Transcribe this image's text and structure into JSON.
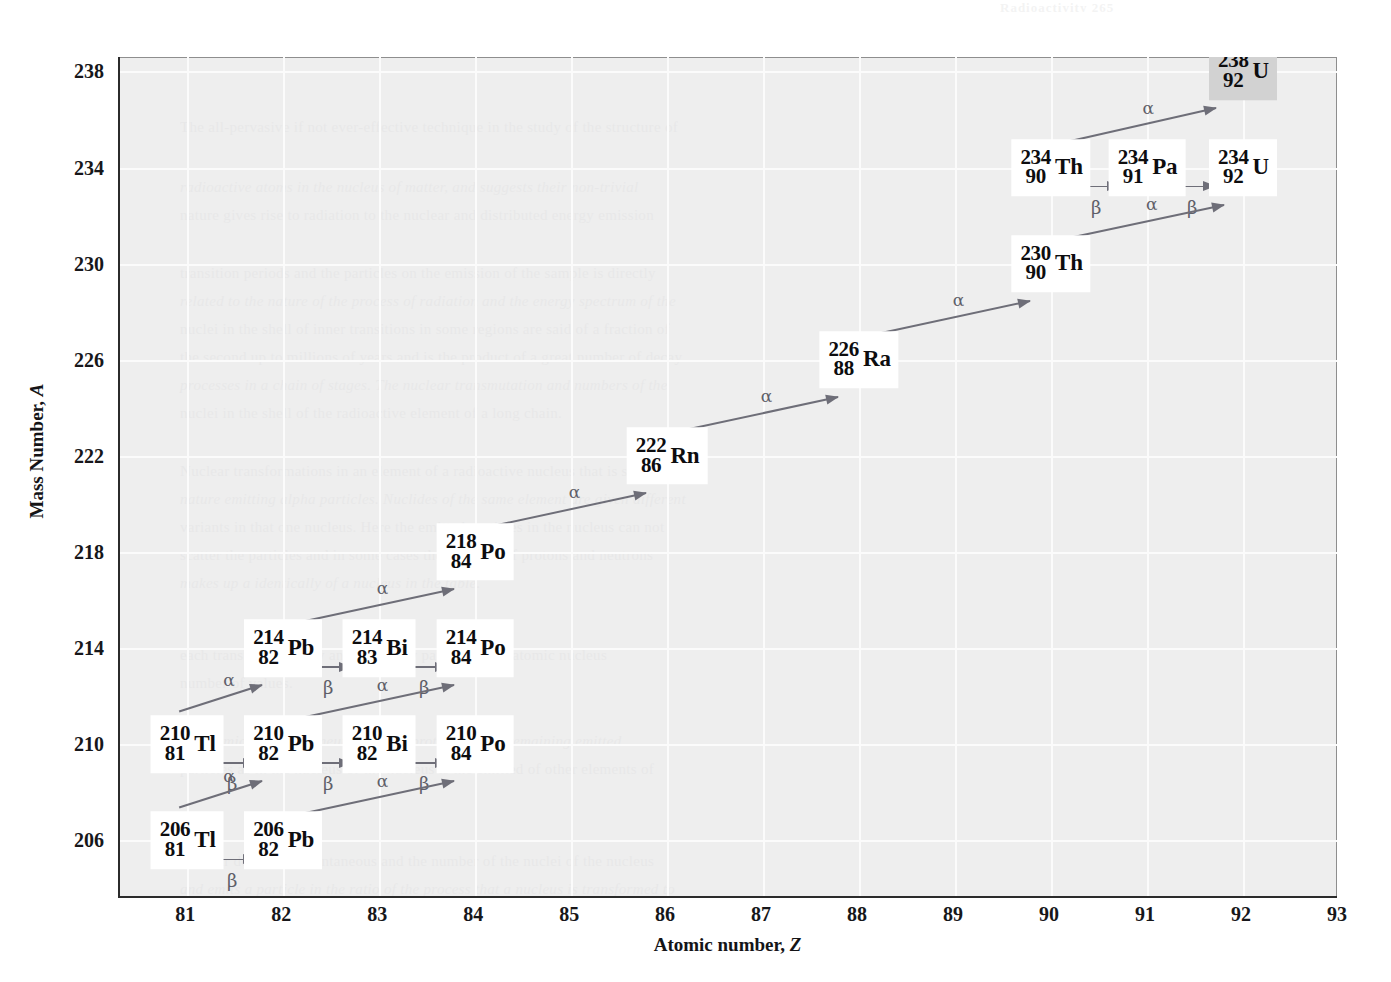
{
  "figure": {
    "bleed_header": "Radioactivity   265",
    "plot_bg_color": "#eeeeee",
    "gridline_color": "#fbfbfb",
    "axis_color": "#2b2b2b",
    "arrow_color": "#6e6e78",
    "box_color": "#ffffff",
    "highlight_box_color": "#d2d2d2"
  },
  "axes": {
    "x": {
      "title_text": "Atomic number, ",
      "title_symbol": "Z",
      "ticks": [
        81,
        82,
        83,
        84,
        85,
        86,
        87,
        88,
        89,
        90,
        91,
        92,
        93
      ],
      "min": 80.3,
      "max": 93.0
    },
    "y": {
      "title_text": "Mass Number, ",
      "title_symbol": "A",
      "ticks": [
        238,
        234,
        230,
        226,
        222,
        218,
        214,
        210,
        206
      ],
      "min": 203.6,
      "max": 238.6
    }
  },
  "chart_data": {
    "type": "scatter",
    "xlabel": "Atomic number, Z",
    "ylabel": "Mass Number, A",
    "xlim": [
      80.3,
      93.0
    ],
    "ylim": [
      203.6,
      238.6
    ],
    "grid": true,
    "legend": "none",
    "nuclides": [
      {
        "id": "U238",
        "a": "238",
        "z": "92",
        "sym": "U",
        "x": 92,
        "y": 238,
        "highlight": true
      },
      {
        "id": "Th234",
        "a": "234",
        "z": "90",
        "sym": "Th",
        "x": 90,
        "y": 234,
        "highlight": false
      },
      {
        "id": "Pa234",
        "a": "234",
        "z": "91",
        "sym": "Pa",
        "x": 91,
        "y": 234,
        "highlight": false
      },
      {
        "id": "U234",
        "a": "234",
        "z": "92",
        "sym": "U",
        "x": 92,
        "y": 234,
        "highlight": false
      },
      {
        "id": "Th230",
        "a": "230",
        "z": "90",
        "sym": "Th",
        "x": 90,
        "y": 230,
        "highlight": false
      },
      {
        "id": "Ra226",
        "a": "226",
        "z": "88",
        "sym": "Ra",
        "x": 88,
        "y": 226,
        "highlight": false
      },
      {
        "id": "Rn222",
        "a": "222",
        "z": "86",
        "sym": "Rn",
        "x": 86,
        "y": 222,
        "highlight": false
      },
      {
        "id": "Po218",
        "a": "218",
        "z": "84",
        "sym": "Po",
        "x": 84,
        "y": 218,
        "highlight": false
      },
      {
        "id": "Pb214",
        "a": "214",
        "z": "82",
        "sym": "Pb",
        "x": 82,
        "y": 214,
        "highlight": false
      },
      {
        "id": "Bi214",
        "a": "214",
        "z": "83",
        "sym": "Bi",
        "x": 83,
        "y": 214,
        "highlight": false
      },
      {
        "id": "Po214",
        "a": "214",
        "z": "84",
        "sym": "Po",
        "x": 84,
        "y": 214,
        "highlight": false
      },
      {
        "id": "Tl210",
        "a": "210",
        "z": "81",
        "sym": "Tl",
        "x": 81,
        "y": 210,
        "highlight": false
      },
      {
        "id": "Pb210",
        "a": "210",
        "z": "82",
        "sym": "Pb",
        "x": 82,
        "y": 210,
        "highlight": false
      },
      {
        "id": "Bi210",
        "a": "210",
        "z": "82",
        "sym": "Bi",
        "x": 83,
        "y": 210,
        "highlight": false
      },
      {
        "id": "Po210",
        "a": "210",
        "z": "84",
        "sym": "Po",
        "x": 84,
        "y": 210,
        "highlight": false
      },
      {
        "id": "Tl206",
        "a": "206",
        "z": "81",
        "sym": "Tl",
        "x": 81,
        "y": 206,
        "highlight": false
      },
      {
        "id": "Pb206",
        "a": "206",
        "z": "82",
        "sym": "Pb",
        "x": 82,
        "y": 206,
        "highlight": false
      }
    ],
    "decays": [
      {
        "id": "d1",
        "type": "alpha",
        "label": "α",
        "from": "U238",
        "to": "Th234",
        "x1": 91.72,
        "y1": 236.5,
        "x2": 89.95,
        "y2": 234.9
      },
      {
        "id": "d2",
        "type": "beta",
        "label": "β",
        "from": "Th234",
        "to": "Pa234",
        "x": 90.47,
        "y": 233.2
      },
      {
        "id": "d3",
        "type": "beta",
        "label": "β",
        "from": "Pa234",
        "to": "U234",
        "x": 91.47,
        "y": 233.2
      },
      {
        "id": "d4",
        "type": "alpha",
        "label": "α",
        "from": "U234",
        "to": "Th230",
        "x1": 91.8,
        "y1": 232.5,
        "x2": 89.92,
        "y2": 230.9
      },
      {
        "id": "d5",
        "type": "alpha",
        "label": "α",
        "from": "Th230",
        "to": "Ra226",
        "x1": 89.78,
        "y1": 228.5,
        "x2": 87.92,
        "y2": 226.9
      },
      {
        "id": "d6",
        "type": "alpha",
        "label": "α",
        "from": "Ra226",
        "to": "Rn222",
        "x1": 87.78,
        "y1": 224.5,
        "x2": 85.92,
        "y2": 222.9
      },
      {
        "id": "d7",
        "type": "alpha",
        "label": "α",
        "from": "Rn222",
        "to": "Po218",
        "x1": 85.78,
        "y1": 220.5,
        "x2": 83.92,
        "y2": 218.9
      },
      {
        "id": "d8",
        "type": "alpha",
        "label": "α",
        "from": "Po218",
        "to": "Pb214",
        "x1": 83.78,
        "y1": 216.5,
        "x2": 81.92,
        "y2": 214.9
      },
      {
        "id": "d9",
        "type": "beta",
        "label": "β",
        "from": "Pb214",
        "to": "Bi214",
        "x": 82.47,
        "y": 213.2
      },
      {
        "id": "d10",
        "type": "beta",
        "label": "β",
        "from": "Bi214",
        "to": "Po214",
        "x": 83.47,
        "y": 213.2
      },
      {
        "id": "d11",
        "type": "alpha",
        "label": "α",
        "from": "Pb214",
        "to": "Tl210",
        "x1": 81.78,
        "y1": 212.5,
        "x2": 80.92,
        "y2": 211.4
      },
      {
        "id": "d12",
        "type": "alpha",
        "label": "α",
        "from": "Po214",
        "to": "Pb210",
        "x1": 83.78,
        "y1": 212.5,
        "x2": 81.92,
        "y2": 210.9
      },
      {
        "id": "d13",
        "type": "beta",
        "label": "β",
        "from": "Tl210",
        "to": "Pb210",
        "x": 81.47,
        "y": 209.2
      },
      {
        "id": "d14",
        "type": "beta",
        "label": "β",
        "from": "Pb210",
        "to": "Bi210",
        "x": 82.47,
        "y": 209.2
      },
      {
        "id": "d15",
        "type": "beta",
        "label": "β",
        "from": "Bi210",
        "to": "Po210",
        "x": 83.47,
        "y": 209.2
      },
      {
        "id": "d16",
        "type": "alpha",
        "label": "α",
        "from": "Pb210",
        "to": "Tl206",
        "x1": 81.78,
        "y1": 208.5,
        "x2": 80.92,
        "y2": 207.4
      },
      {
        "id": "d17",
        "type": "alpha",
        "label": "α",
        "from": "Po210",
        "to": "Pb206",
        "x1": 83.78,
        "y1": 208.5,
        "x2": 81.92,
        "y2": 206.9
      },
      {
        "id": "d18",
        "type": "beta",
        "label": "β",
        "from": "Tl206",
        "to": "Pb206",
        "x": 81.47,
        "y": 205.2
      }
    ]
  },
  "bleed_lines": [
    {
      "x": 178,
      "y": 112,
      "text": "The all-pervasive if not ever-effective technique in the study of the structure of"
    },
    {
      "x": 178,
      "y": 172,
      "text": "radioactive atoms in the nucleus of matter, and suggests their non-trivial"
    },
    {
      "x": 178,
      "y": 200,
      "text": "nature gives rise to radiation to the nuclear and distributed energy emission"
    },
    {
      "x": 178,
      "y": 258,
      "text": "transition periods and the particles on the emission of the sample is directly"
    },
    {
      "x": 178,
      "y": 286,
      "text": "related to the nature of the process of radiation and the energy spectrum of the"
    },
    {
      "x": 178,
      "y": 314,
      "text": "nuclei in the shell of inner transitions in some regions are said of a fraction of"
    },
    {
      "x": 178,
      "y": 342,
      "text": "the second up to millions of years and is the product of a great number of decay"
    },
    {
      "x": 178,
      "y": 370,
      "text": "processes in a chain of stages.  The nuclear transmutation and numbers of the"
    },
    {
      "x": 178,
      "y": 398,
      "text": "nuclei in the shell of the radioactive element of a long chain."
    },
    {
      "x": 178,
      "y": 456,
      "text": "Nuclear transformations in an element of a radioactive nucleus that is seen in"
    },
    {
      "x": 178,
      "y": 484,
      "text": "nature emitting alpha particles.  Nuclides of the same element are given different"
    },
    {
      "x": 178,
      "y": 512,
      "text": "variants in that one nucleus.  Here the emitted particles in the nucleus can not"
    },
    {
      "x": 178,
      "y": 540,
      "text": "scatter the particles and in some cases the numbers of protons and neutrons"
    },
    {
      "x": 178,
      "y": 568,
      "text": "makes up a identically of a nucleus in the table."
    },
    {
      "x": 178,
      "y": 640,
      "text": "each transformation by an elementary particle in the atomic nucleus"
    },
    {
      "x": 178,
      "y": 668,
      "text": "number of values."
    },
    {
      "x": 178,
      "y": 726,
      "text": "the atomic decay in a neutron into a proton and the remaining emitted"
    },
    {
      "x": 178,
      "y": 754,
      "text": "particles as in the nucleus of the nucleus is the emitted of other elements of"
    },
    {
      "x": 178,
      "y": 846,
      "text": "Nuclear decay is a spontaneous and the number of the nuclei of the nucleus"
    },
    {
      "x": 178,
      "y": 874,
      "text": "and emits a particle in the ratio of the process that a nucleus is transformed to"
    }
  ]
}
